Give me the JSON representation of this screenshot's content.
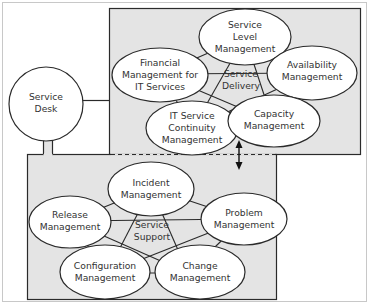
{
  "colors": {
    "frame": "#c8c8c8",
    "box_fill": "#e4e4e4",
    "stroke": "#2a2a2a",
    "ellipse_fill": "#ffffff",
    "text": "#333333"
  },
  "service_desk": {
    "line1": "Service",
    "line2": "Desk"
  },
  "service_delivery": {
    "center_line1": "Service",
    "center_line2": "Delivery",
    "nodes": [
      {
        "id": "slm",
        "lines": [
          "Service",
          "Level",
          "Management"
        ]
      },
      {
        "id": "fin",
        "lines": [
          "Financial",
          "Management for",
          "IT Services"
        ]
      },
      {
        "id": "avail",
        "lines": [
          "Availability",
          "Management"
        ]
      },
      {
        "id": "itscm",
        "lines": [
          "IT Service",
          "Continuity",
          "Management"
        ]
      },
      {
        "id": "cap",
        "lines": [
          "Capacity",
          "Management"
        ]
      }
    ]
  },
  "service_support": {
    "center_line1": "Service",
    "center_line2": "Support",
    "nodes": [
      {
        "id": "inc",
        "lines": [
          "Incident",
          "Management"
        ]
      },
      {
        "id": "rel",
        "lines": [
          "Release",
          "Management"
        ]
      },
      {
        "id": "prob",
        "lines": [
          "Problem",
          "Management"
        ]
      },
      {
        "id": "conf",
        "lines": [
          "Configuration",
          "Management"
        ]
      },
      {
        "id": "chg",
        "lines": [
          "Change",
          "Management"
        ]
      }
    ]
  }
}
